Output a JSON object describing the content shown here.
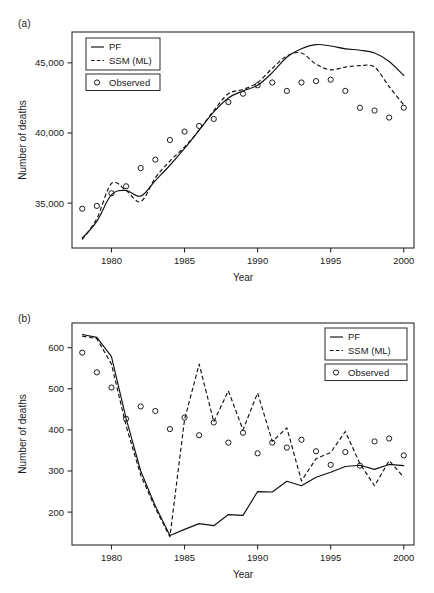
{
  "figure": {
    "panel_a_label": "(a)",
    "panel_b_label": "(b)"
  },
  "legend": {
    "pf": "PF",
    "ssm": "SSM (ML)",
    "observed": "Observed",
    "observed_marker": "o"
  },
  "chart_data": [
    {
      "type": "line",
      "panel": "(a)",
      "title": "",
      "xlabel": "Year",
      "ylabel": "Number of deaths",
      "xlim": [
        1977.3,
        2000.7
      ],
      "ylim": [
        31800,
        47200
      ],
      "xticks": [
        1980,
        1985,
        1990,
        1995,
        2000
      ],
      "xticklabels": [
        "1980",
        "1985",
        "1990",
        "1995",
        "2000"
      ],
      "yticks": [
        35000,
        40000,
        45000
      ],
      "yticklabels": [
        "35,000",
        "40,000",
        "45,000"
      ],
      "grid": false,
      "legend_position": "top-left",
      "x": [
        1978,
        1979,
        1980,
        1981,
        1982,
        1983,
        1984,
        1985,
        1986,
        1987,
        1988,
        1989,
        1990,
        1991,
        1992,
        1993,
        1994,
        1995,
        1996,
        1997,
        1998,
        1999,
        2000
      ],
      "series": [
        {
          "name": "PF",
          "style": "solid",
          "values": [
            32500,
            33700,
            35600,
            35900,
            35500,
            36600,
            37700,
            38900,
            40200,
            41500,
            42500,
            43000,
            43400,
            44300,
            45400,
            46000,
            46300,
            46200,
            46000,
            45900,
            45700,
            45100,
            44100
          ]
        },
        {
          "name": "SSM (ML)",
          "style": "dashed",
          "values": [
            32400,
            33900,
            36400,
            35900,
            35100,
            36800,
            38000,
            39000,
            40200,
            41600,
            42800,
            43100,
            43600,
            44600,
            45500,
            45700,
            44900,
            44500,
            44700,
            44800,
            44700,
            43300,
            42000
          ]
        },
        {
          "name": "Observed",
          "style": "points",
          "values": [
            34600,
            34800,
            35700,
            36200,
            37500,
            38100,
            39500,
            40100,
            40500,
            41000,
            42200,
            42800,
            43400,
            43600,
            43000,
            43600,
            43700,
            43800,
            43000,
            41800,
            41600,
            41100,
            41800
          ]
        }
      ]
    },
    {
      "type": "line",
      "panel": "(b)",
      "title": "",
      "xlabel": "Year",
      "ylabel": "Number of deaths",
      "xlim": [
        1977.3,
        2000.7
      ],
      "ylim": [
        120,
        660
      ],
      "xticks": [
        1980,
        1985,
        1990,
        1995,
        2000
      ],
      "xticklabels": [
        "1980",
        "1985",
        "1990",
        "1995",
        "2000"
      ],
      "yticks": [
        200,
        300,
        400,
        500,
        600
      ],
      "yticklabels": [
        "200",
        "300",
        "400",
        "500",
        "600"
      ],
      "grid": false,
      "legend_position": "top-right",
      "x": [
        1978,
        1979,
        1980,
        1981,
        1982,
        1983,
        1984,
        1985,
        1986,
        1987,
        1988,
        1989,
        1990,
        1991,
        1992,
        1993,
        1994,
        1995,
        1996,
        1997,
        1998,
        1999,
        2000
      ],
      "series": [
        {
          "name": "PF",
          "style": "solid",
          "values": [
            632,
            625,
            578,
            428,
            300,
            215,
            143,
            158,
            172,
            167,
            194,
            192,
            250,
            249,
            275,
            264,
            285,
            297,
            311,
            314,
            304,
            316,
            313
          ]
        },
        {
          "name": "SSM (ML)",
          "style": "dashed",
          "values": [
            628,
            622,
            560,
            410,
            290,
            210,
            140,
            425,
            560,
            420,
            495,
            400,
            490,
            372,
            405,
            276,
            330,
            345,
            396,
            318,
            264,
            325,
            285
          ]
        },
        {
          "name": "Observed",
          "style": "points",
          "values": [
            588,
            540,
            503,
            427,
            457,
            446,
            402,
            430,
            387,
            418,
            369,
            393,
            343,
            369,
            357,
            376,
            348,
            315,
            346,
            313,
            372,
            379,
            338
          ]
        }
      ]
    }
  ]
}
